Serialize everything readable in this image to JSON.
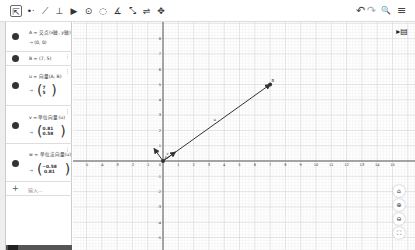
{
  "toolbar": {
    "tools": [
      {
        "name": "move-tool",
        "glyph": "⇱"
      },
      {
        "name": "point-tool",
        "glyph": "•ᐧ"
      },
      {
        "name": "line-tool",
        "glyph": "⟋"
      },
      {
        "name": "perpendicular-tool",
        "glyph": "⊥"
      },
      {
        "name": "polygon-tool",
        "glyph": "▶"
      },
      {
        "name": "circle-tool",
        "glyph": "⊙"
      },
      {
        "name": "circle-three-points-tool",
        "glyph": "◌"
      },
      {
        "name": "angle-tool",
        "glyph": "∡"
      },
      {
        "name": "reflect-tool",
        "glyph": "⤡"
      },
      {
        "name": "slider-tool",
        "glyph": "⇌"
      },
      {
        "name": "move-graphics-tool",
        "glyph": "✥"
      }
    ],
    "undo": "↶",
    "redo": "↷",
    "search": "🔍",
    "menu": "≡"
  },
  "algebra": {
    "items": [
      {
        "definition": "A = 交点(x轴, y轴)",
        "value": "→ (0, 0)"
      },
      {
        "definition": "B = (7, 5)",
        "value": ""
      },
      {
        "definition": "u = 向量(A, B)",
        "value": "→",
        "vector": [
          "7",
          "5"
        ]
      },
      {
        "definition": "v = 单位向量(u)",
        "value": "→",
        "vector": [
          "0.81",
          "0.58"
        ]
      },
      {
        "definition": "w = 单位法向量(u)",
        "value": "→",
        "vector": [
          "−0.58",
          "0.81"
        ]
      }
    ],
    "input_placeholder": "输入..."
  },
  "graph": {
    "origin_px": [
      90,
      139
    ],
    "unit_px": 15.3,
    "x_ticks": [
      "-5",
      "-4",
      "-3",
      "-2",
      "-1",
      "0",
      "1",
      "2",
      "3",
      "4",
      "5",
      "6",
      "7",
      "8",
      "9",
      "10",
      "11",
      "12",
      "13",
      "14",
      "15"
    ],
    "y_ticks_pos": [
      "1",
      "2",
      "3",
      "4",
      "5",
      "6",
      "7",
      "8"
    ],
    "y_ticks_neg": [
      "-1",
      "-2",
      "-3",
      "-4",
      "-5"
    ],
    "points": [
      {
        "label": "A",
        "x": 0,
        "y": 0
      },
      {
        "label": "B",
        "x": 7,
        "y": 5
      }
    ],
    "vectors": [
      {
        "label": "u",
        "from": [
          0,
          0
        ],
        "to": [
          7,
          5
        ]
      },
      {
        "label": "v",
        "from": [
          0,
          0
        ],
        "to": [
          0.81,
          0.58
        ]
      },
      {
        "label": "w",
        "from": [
          0,
          0
        ],
        "to": [
          -0.58,
          0.81
        ]
      }
    ]
  },
  "side_controls": {
    "home": "⌂",
    "zoom_in": "⊕",
    "zoom_out": "⊖",
    "fullscreen": "⛶",
    "style_bar": "▸▤"
  }
}
